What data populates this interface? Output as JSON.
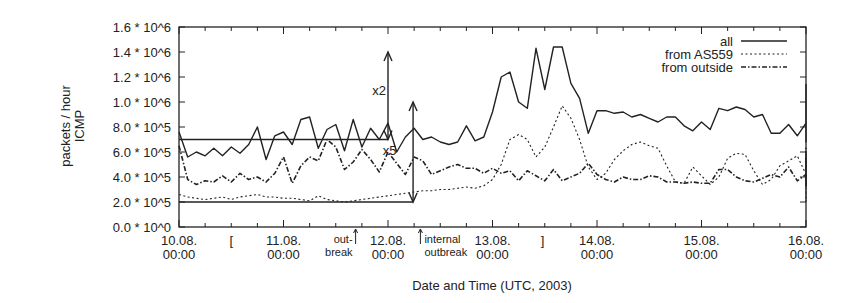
{
  "chart_data": {
    "type": "line",
    "title": "",
    "xlabel": "Date and Time (UTC, 2003)",
    "ylabel": [
      "packets / hour",
      "ICMP"
    ],
    "ylim": [
      0,
      1600000
    ],
    "xlim_days": [
      0,
      6
    ],
    "grid": false,
    "legend_position": "top-right",
    "y_ticks": [
      {
        "value": 0,
        "label": "0.0 * 10^0"
      },
      {
        "value": 200000,
        "label": "2.0 * 10^5"
      },
      {
        "value": 400000,
        "label": "4.0 * 10^5"
      },
      {
        "value": 600000,
        "label": "6.0 * 10^5"
      },
      {
        "value": 800000,
        "label": "8.0 * 10^5"
      },
      {
        "value": 1000000,
        "label": "1.0 * 10^6"
      },
      {
        "value": 1200000,
        "label": "1.2 * 10^6"
      },
      {
        "value": 1400000,
        "label": "1.4 * 10^6"
      },
      {
        "value": 1600000,
        "label": "1.6 * 10^6"
      }
    ],
    "x_ticks": [
      {
        "day": 0,
        "label": [
          "10.08.",
          "00:00"
        ]
      },
      {
        "day": 1,
        "label": [
          "11.08.",
          "00:00"
        ]
      },
      {
        "day": 2,
        "label": [
          "12.08.",
          "00:00"
        ]
      },
      {
        "day": 3,
        "label": [
          "13.08.",
          "00:00"
        ]
      },
      {
        "day": 4,
        "label": [
          "14.08.",
          "00:00"
        ]
      },
      {
        "day": 5,
        "label": [
          "15.08.",
          "00:00"
        ]
      },
      {
        "day": 6,
        "label": [
          "16.08.",
          "00:00"
        ]
      }
    ],
    "x_minor_ticks_per_day": 3,
    "unit_note": "series values in units of 10^5 packets/hour, sampled every 2 hours starting 10.08. 00:00",
    "x_step_hours": 2,
    "series": [
      {
        "name": "all",
        "style": "solid",
        "values": [
          7.6,
          5.6,
          6.0,
          5.7,
          6.3,
          5.7,
          6.4,
          5.9,
          6.6,
          8.0,
          5.4,
          7.3,
          7.6,
          6.6,
          8.6,
          8.8,
          6.3,
          7.8,
          8.2,
          6.1,
          8.6,
          6.4,
          7.9,
          7.0,
          8.3,
          6.0,
          7.2,
          7.9,
          7.0,
          7.2,
          6.8,
          6.6,
          6.8,
          8.1,
          6.9,
          7.2,
          9.2,
          12.0,
          12.4,
          10.0,
          9.5,
          14.3,
          11.0,
          14.4,
          14.4,
          11.5,
          10.3,
          7.5,
          9.3,
          9.3,
          9.1,
          9.2,
          8.8,
          9.0,
          8.7,
          8.4,
          8.8,
          8.8,
          8.1,
          7.7,
          8.4,
          7.8,
          9.5,
          9.3,
          9.6,
          9.4,
          8.8,
          9.0,
          7.5,
          7.5,
          8.2,
          7.3,
          8.3,
          7.5,
          9.0,
          9.4,
          6.9,
          10.6,
          7.6,
          8.1,
          7.2,
          6.8,
          7.4,
          7.3,
          7.8,
          7.8,
          8.7,
          8.2,
          7.7,
          8.0,
          8.2,
          7.9,
          9.0,
          7.9,
          7.0,
          8.1,
          8.0,
          11.4,
          9.0,
          8.9,
          9.0,
          7.7,
          8.3,
          7.6,
          10.2,
          8.6,
          9.2,
          8.6,
          7.9,
          8.4,
          6.9,
          6.8,
          7.2,
          8.2,
          8.9,
          8.5,
          9.6,
          8.8,
          9.4,
          9.0,
          8.9,
          10.9,
          8.9,
          8.5,
          8.2,
          7.6,
          8.1,
          8.8,
          8.5,
          8.0,
          8.2,
          7.7,
          7.6,
          8.4,
          9.8,
          7.2,
          10.7,
          8.0,
          8.3
        ]
      },
      {
        "name": "from AS559",
        "style": "dotted",
        "values": [
          2.6,
          2.4,
          2.3,
          2.2,
          2.3,
          2.4,
          2.2,
          2.4,
          2.5,
          2.6,
          2.4,
          2.4,
          2.3,
          2.3,
          2.2,
          2.1,
          2.5,
          2.2,
          2.1,
          2.0,
          2.1,
          2.2,
          2.3,
          2.4,
          2.5,
          2.6,
          2.7,
          2.8,
          2.9,
          2.9,
          3.0,
          3.0,
          3.1,
          3.2,
          3.1,
          3.3,
          3.8,
          5.0,
          7.0,
          7.4,
          7.0,
          5.6,
          6.4,
          8.0,
          9.7,
          8.7,
          7.0,
          4.8,
          3.8,
          4.3,
          5.4,
          6.1,
          6.6,
          6.8,
          6.5,
          6.3,
          4.9,
          3.6,
          3.5,
          4.8,
          4.1,
          3.4,
          4.0,
          5.5,
          5.9,
          5.8,
          4.5,
          3.4,
          3.8,
          4.9,
          5.3,
          5.7,
          4.2,
          3.6,
          3.7,
          4.1,
          3.9,
          4.0,
          3.3,
          3.6,
          4.0,
          5.6,
          3.2,
          4.2,
          4.0,
          4.3,
          3.8,
          3.7,
          4.3,
          3.7,
          3.0,
          3.4,
          3.5,
          3.3,
          3.5,
          3.7,
          4.0,
          3.8,
          3.5,
          3.4,
          3.6,
          3.4,
          3.0,
          3.8,
          3.6,
          2.7,
          2.4,
          3.3,
          4.0,
          3.6,
          3.7,
          4.7,
          5.5,
          5.3,
          4.7,
          5.0,
          4.6,
          4.0,
          3.6,
          3.8,
          4.3,
          4.1,
          3.8,
          4.3,
          3.6,
          4.2,
          4.1,
          3.9,
          3.7,
          3.5,
          3.6,
          3.4,
          2.8,
          2.0,
          3.3,
          3.0,
          3.2
        ]
      },
      {
        "name": "from outside",
        "style": "dashdot",
        "values": [
          6.5,
          3.8,
          3.4,
          3.7,
          3.6,
          4.1,
          3.6,
          4.3,
          3.8,
          4.0,
          3.6,
          4.3,
          5.6,
          3.5,
          4.9,
          5.6,
          5.3,
          7.0,
          6.4,
          4.6,
          5.2,
          6.2,
          5.4,
          4.4,
          6.0,
          5.1,
          4.2,
          5.6,
          5.3,
          4.2,
          4.5,
          4.8,
          5.0,
          4.7,
          4.7,
          4.3,
          4.7,
          4.3,
          4.5,
          3.7,
          4.5,
          4.1,
          3.7,
          4.6,
          3.7,
          4.0,
          4.3,
          5.1,
          4.2,
          3.8,
          3.6,
          4.0,
          3.8,
          3.8,
          4.1,
          4.0,
          3.6,
          3.6,
          3.5,
          3.6,
          3.5,
          3.5,
          4.6,
          4.6,
          4.0,
          3.7,
          3.6,
          3.9,
          4.2,
          4.0,
          4.8,
          3.7,
          4.2,
          3.8,
          4.4,
          4.1,
          3.7,
          3.9,
          4.1,
          3.9,
          4.0,
          3.6,
          3.8,
          4.3,
          3.6,
          3.5,
          3.7,
          6.3,
          3.7,
          3.7,
          3.6,
          4.2,
          4.4,
          3.3,
          3.9,
          4.7,
          4.2,
          4.0,
          3.7,
          4.0,
          3.9,
          4.1,
          3.6,
          3.8,
          3.6,
          3.4,
          3.8,
          3.4,
          6.0,
          4.5,
          3.7,
          3.7,
          3.8,
          3.9,
          4.5,
          4.6,
          4.2,
          3.6,
          3.7,
          4.1,
          3.6,
          3.9,
          4.4,
          3.8,
          4.3,
          3.5,
          4.2,
          3.9,
          4.4,
          4.5,
          4.4,
          3.8,
          3.6,
          4.4,
          6.0,
          4.6,
          3.6,
          6.0,
          4.0,
          5.3
        ]
      }
    ],
    "annotations": {
      "level_lines": [
        {
          "name": "all-baseline",
          "value": 700000,
          "from_day": 0,
          "to_day": 2.0
        },
        {
          "name": "outside-baseline",
          "value": 200000,
          "from_day": 0,
          "to_day": 2.24
        }
      ],
      "arrows": [
        {
          "name": "x2-arrow",
          "day": 2.0,
          "from_value": 700000,
          "to_value": 1400000,
          "label": "x2",
          "label_day": 1.85,
          "label_value": 1100000
        },
        {
          "name": "x5-arrow",
          "day": 2.24,
          "from_value": 200000,
          "to_value": 1000000,
          "label": "x5",
          "label_day": 1.95,
          "label_value": 620000
        }
      ],
      "events": [
        {
          "name": "outbreak",
          "day": 1.69,
          "label": [
            "out-",
            "break"
          ]
        },
        {
          "name": "internal-outbreak",
          "day": 2.31,
          "label": [
            "internal",
            "outbreak"
          ]
        }
      ],
      "brackets": [
        {
          "name": "bracket-open",
          "day": 0.5,
          "symbol": "["
        },
        {
          "name": "bracket-close",
          "day": 3.48,
          "symbol": "]"
        }
      ]
    }
  },
  "legend": {
    "items": [
      {
        "label": "all",
        "style": "solid"
      },
      {
        "label": "from AS559",
        "style": "dotted"
      },
      {
        "label": "from outside",
        "style": "dashdot"
      }
    ]
  },
  "axes": {
    "xlabel": "Date and Time (UTC, 2003)",
    "ylabel_line1": "packets / hour",
    "ylabel_line2": "ICMP"
  },
  "colors": {
    "ink": "#222222",
    "background": "#ffffff"
  }
}
